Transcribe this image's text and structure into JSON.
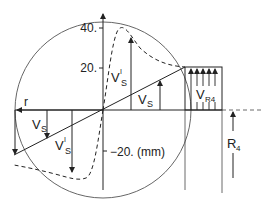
{
  "diagram": {
    "y_ticks": [
      {
        "label": "40.",
        "y": 26
      },
      {
        "label": "20.",
        "y": 68
      },
      {
        "label": "−20. (mm)",
        "y": 152
      }
    ],
    "labels": {
      "r": "r",
      "vs_right_main": "V",
      "vs_right_sub": "S",
      "vps_upper_main": "V",
      "vps_upper_sup": "I",
      "vps_upper_sub": "S",
      "vs_left_main": "V",
      "vs_left_sub": "S",
      "vps_lower_main": "V",
      "vps_lower_sup": "I",
      "vps_lower_sub": "S",
      "vr4_main": "V",
      "vr4_sub": "R4",
      "r4_main": "R",
      "r4_sub": "4"
    },
    "colors": {
      "stroke": "#222222",
      "circle": "#555555"
    }
  }
}
